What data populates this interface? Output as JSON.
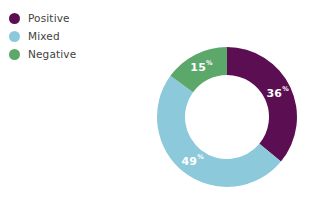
{
  "background_color": "#ffffff",
  "text_color": "#3f3f41",
  "legend": {
    "position": "top-left",
    "items": [
      {
        "label": "Positive",
        "color": "#5c0e52",
        "dot_icon": "legend-dot-icon"
      },
      {
        "label": "Mixed",
        "color": "#8cc9db",
        "dot_icon": "legend-dot-icon"
      },
      {
        "label": "Negative",
        "color": "#5ca86b",
        "dot_icon": "legend-dot-icon"
      }
    ]
  },
  "chart_data": {
    "type": "pie",
    "variant": "donut",
    "title": "",
    "subtitle": "",
    "xlabel": "",
    "ylabel": "",
    "grid": false,
    "legend_position": "top-left",
    "start_angle_deg": 0,
    "direction": "clockwise",
    "categories": [
      "Positive",
      "Mixed",
      "Negative"
    ],
    "values": [
      36,
      49,
      15
    ],
    "units": "%",
    "colors": [
      "#5c0e52",
      "#8cc9db",
      "#5ca86b"
    ],
    "data_labels": [
      "36",
      "49",
      "15"
    ],
    "data_label_suffix": "%",
    "data_label_color": "#ffffff",
    "inner_radius_ratio": 0.6,
    "slices": [
      {
        "name": "Positive",
        "value": 36,
        "label": "36",
        "suffix": "%",
        "color": "#5c0e52"
      },
      {
        "name": "Mixed",
        "value": 49,
        "label": "49",
        "suffix": "%",
        "color": "#8cc9db"
      },
      {
        "name": "Negative",
        "value": 15,
        "label": "15",
        "suffix": "%",
        "color": "#5ca86b"
      }
    ]
  }
}
